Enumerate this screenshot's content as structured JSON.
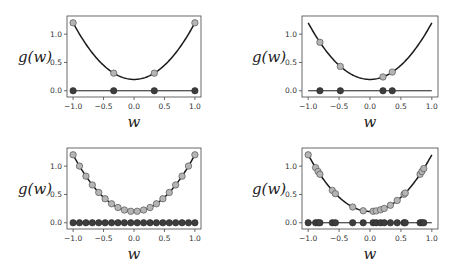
{
  "figure": {
    "width": 460,
    "height": 268,
    "colors": {
      "curve": "#1a1a1a",
      "point_fill": "#b5b5b5",
      "point_edge": "#555555",
      "input_fill": "#3d3d3d",
      "axis": "#444444",
      "tick_text": "#333333"
    }
  },
  "chart_data": [
    {
      "type": "line",
      "panel": "top-left",
      "title": "",
      "function": "g(w) = w^2 + 0.2",
      "xlabel": "w",
      "ylabel": "g(w)",
      "xlim": [
        -1.1,
        1.1
      ],
      "ylim": [
        -0.11,
        1.32
      ],
      "xticks": [
        "-1.0",
        "-0.5",
        "0.0",
        "0.5",
        "1.0"
      ],
      "yticks": [
        "0.0",
        "0.5",
        "1.0"
      ],
      "grid": false,
      "samples_w": [
        -1.0,
        -0.333,
        0.333,
        1.0
      ],
      "samples_g": [
        1.2,
        0.311,
        0.311,
        1.2
      ]
    },
    {
      "type": "line",
      "panel": "top-right",
      "title": "",
      "function": "g(w) = w^2 + 0.2",
      "xlabel": "w",
      "ylabel": "g(w)",
      "xlim": [
        -1.1,
        1.1
      ],
      "ylim": [
        -0.11,
        1.32
      ],
      "xticks": [
        "-1.0",
        "-0.5",
        "0.0",
        "0.5",
        "1.0"
      ],
      "yticks": [
        "0.0",
        "0.5",
        "1.0"
      ],
      "grid": false,
      "samples_w": [
        -0.81,
        -0.48,
        0.21,
        0.36
      ],
      "samples_g": [
        0.856,
        0.43,
        0.244,
        0.33
      ]
    },
    {
      "type": "line",
      "panel": "bottom-left",
      "title": "",
      "function": "g(w) = w^2 + 0.2",
      "xlabel": "w",
      "ylabel": "g(w)",
      "xlim": [
        -1.1,
        1.1
      ],
      "ylim": [
        -0.11,
        1.32
      ],
      "xticks": [
        "-1.0",
        "-0.5",
        "0.0",
        "0.5",
        "1.0"
      ],
      "yticks": [
        "0.0",
        "0.5",
        "1.0"
      ],
      "grid": false,
      "samples_w": [
        -1.0,
        -0.895,
        -0.789,
        -0.684,
        -0.579,
        -0.474,
        -0.368,
        -0.263,
        -0.158,
        -0.053,
        0.053,
        0.158,
        0.263,
        0.368,
        0.474,
        0.579,
        0.684,
        0.789,
        0.895,
        1.0
      ],
      "samples_g": [
        1.2,
        1.001,
        0.823,
        0.668,
        0.535,
        0.424,
        0.335,
        0.269,
        0.225,
        0.203,
        0.203,
        0.225,
        0.269,
        0.335,
        0.424,
        0.535,
        0.668,
        0.823,
        1.001,
        1.2
      ]
    },
    {
      "type": "line",
      "panel": "bottom-right",
      "title": "",
      "function": "g(w) = w^2 + 0.2",
      "xlabel": "w",
      "ylabel": "g(w)",
      "xlim": [
        -1.1,
        1.1
      ],
      "ylim": [
        -0.11,
        1.32
      ],
      "xticks": [
        "-1.0",
        "-0.5",
        "0.0",
        "0.5",
        "1.0"
      ],
      "yticks": [
        "0.0",
        "0.5",
        "1.0"
      ],
      "grid": false,
      "samples_w": [
        -1.0,
        -0.88,
        -0.84,
        -0.81,
        -0.61,
        -0.56,
        -0.28,
        -0.11,
        0.05,
        0.1,
        0.17,
        0.23,
        0.33,
        0.44,
        0.55,
        0.57,
        0.81,
        0.84,
        0.87
      ],
      "samples_g": [
        1.2,
        0.974,
        0.906,
        0.856,
        0.572,
        0.514,
        0.278,
        0.212,
        0.203,
        0.21,
        0.229,
        0.253,
        0.309,
        0.394,
        0.503,
        0.525,
        0.856,
        0.906,
        0.957
      ]
    }
  ],
  "panels": [
    {
      "x": 67,
      "y": 16,
      "w": 134,
      "h": 81,
      "ylabel_x": 18,
      "ylabel_y": 62
    },
    {
      "x": 302,
      "y": 16,
      "w": 136,
      "h": 81,
      "ylabel_x": 252,
      "ylabel_y": 62
    },
    {
      "x": 67,
      "y": 148,
      "w": 134,
      "h": 81,
      "ylabel_x": 18,
      "ylabel_y": 194
    },
    {
      "x": 302,
      "y": 148,
      "w": 136,
      "h": 81,
      "ylabel_x": 252,
      "ylabel_y": 194
    }
  ]
}
